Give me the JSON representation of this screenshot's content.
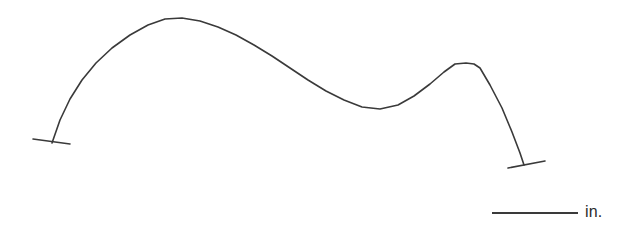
{
  "figure": {
    "background_color": "#ffffff",
    "stroke_color": "#3a3a3a",
    "width": 626,
    "height": 228
  },
  "scale_bar": {
    "label": "in.",
    "line_color": "#3a3a3a",
    "line_x_start": 492,
    "line_x_end": 578,
    "line_y": 213,
    "line_thickness": 2,
    "label_x": 585,
    "label_y": 203
  },
  "chart_data": {
    "type": "line",
    "title": "",
    "xlabel": "",
    "ylabel": "",
    "grid": false,
    "legend": null,
    "axis_visible": false,
    "units": "in.",
    "xlim": [
      0,
      626
    ],
    "ylim": [
      228,
      0
    ],
    "series": [
      {
        "name": "profile-curve",
        "stroke": "#3a3a3a",
        "stroke_width": 1.6,
        "x": [
          52,
          60,
          70,
          82,
          96,
          112,
          130,
          148,
          165,
          182,
          200,
          218,
          236,
          254,
          272,
          290,
          308,
          326,
          344,
          362,
          380,
          398,
          414,
          430,
          444,
          455,
          466,
          474,
          480,
          490,
          502,
          512,
          520,
          524
        ],
        "y": [
          143,
          120,
          99,
          80,
          63,
          48,
          35,
          25,
          19,
          18,
          21,
          27,
          35,
          45,
          56,
          68,
          80,
          91,
          100,
          107,
          109,
          105,
          96,
          84,
          72,
          64,
          63,
          64,
          68,
          85,
          108,
          132,
          153,
          165
        ]
      }
    ],
    "markers": [
      {
        "name": "left-end-tick",
        "x1": 33,
        "y1": 139,
        "x2": 70,
        "y2": 144
      },
      {
        "name": "right-end-tick",
        "x1": 508,
        "y1": 168,
        "x2": 545,
        "y2": 161
      }
    ]
  }
}
